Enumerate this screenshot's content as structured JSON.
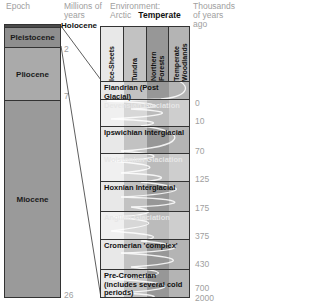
{
  "headers": {
    "epoch": "Epoch",
    "millions": "Millions of years",
    "environment_label": "Environment:",
    "arctic": "Arctic",
    "temperate": "Temperate",
    "thousands": "Thousands of years ago"
  },
  "epochs": [
    {
      "name": "Holocene",
      "top": 0,
      "height": 3
    },
    {
      "name": "Pleistocene",
      "top": 3,
      "height": 20
    },
    {
      "name": "Pliocene",
      "top": 23,
      "height": 53
    },
    {
      "name": "Miocene",
      "top": 76,
      "height": 198
    }
  ],
  "holocene_label": "Holocene",
  "million_ticks": [
    {
      "label": "2",
      "y": 50
    },
    {
      "label": "7",
      "y": 96
    },
    {
      "label": "26",
      "y": 293
    }
  ],
  "environment_columns": [
    {
      "label": "Ice-Sheets",
      "color": "#e8e8e8"
    },
    {
      "label": "Tundra",
      "color": "#c2c2c2"
    },
    {
      "label": "Northern Forests",
      "color": "#979797"
    },
    {
      "label": "Temperate Woodlands",
      "color": "#b4b4b4"
    }
  ],
  "stages": [
    {
      "name": "Flandrian (Post Glacial)",
      "type": "warm",
      "top": 54,
      "height": 18
    },
    {
      "name": "Devensian Glaciation",
      "type": "cold",
      "top": 72,
      "height": 27
    },
    {
      "name": "Ipswichian Interglacial",
      "type": "warm",
      "top": 99,
      "height": 27
    },
    {
      "name": "Wolstonian Glaciation",
      "type": "cold",
      "top": 126,
      "height": 28
    },
    {
      "name": "Hoxnian Interglacial",
      "type": "warm",
      "top": 154,
      "height": 30
    },
    {
      "name": "Anglian Glaciation",
      "type": "cold",
      "top": 184,
      "height": 28
    },
    {
      "name": "Cromerian 'complex'",
      "type": "warm",
      "top": 212,
      "height": 30
    },
    {
      "name": "Pre-Cromerian (includes several cold periods)",
      "type": "warm",
      "top": 242,
      "height": 30
    }
  ],
  "thousand_ticks": [
    {
      "label": "0",
      "y": 76
    },
    {
      "label": "10",
      "y": 94
    },
    {
      "label": "70",
      "y": 120
    },
    {
      "label": "125",
      "y": 148
    },
    {
      "label": "175",
      "y": 176
    },
    {
      "label": "375",
      "y": 206
    },
    {
      "label": "430",
      "y": 233
    },
    {
      "label": "700",
      "y": 263
    },
    {
      "label": "2000",
      "y": 293
    }
  ]
}
